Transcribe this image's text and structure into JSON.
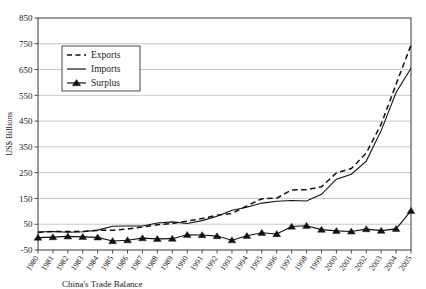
{
  "chart_data": {
    "type": "line",
    "title": "",
    "xlabel": "",
    "ylabel": "US$ Billions",
    "ylim": [
      -50,
      850
    ],
    "ytick_step": 100,
    "grid": true,
    "legend_position": "upper-left-inside",
    "yticks": [
      "-50",
      "50",
      "150",
      "250",
      "350",
      "450",
      "550",
      "650",
      "750",
      "850"
    ],
    "categories": [
      "1980",
      "1981",
      "1982",
      "1983",
      "1984",
      "1985",
      "1986",
      "1987",
      "1988",
      "1989",
      "1990",
      "1991",
      "1992",
      "1993",
      "1994",
      "1995",
      "1996",
      "1997",
      "1998",
      "1999",
      "2000",
      "2001",
      "2002",
      "2003",
      "2004",
      "2005"
    ],
    "series": [
      {
        "name": "Exports",
        "style": "dashed",
        "values": [
          18,
          22,
          22,
          22,
          26,
          27,
          31,
          39,
          48,
          53,
          62,
          72,
          85,
          92,
          121,
          149,
          151,
          183,
          184,
          195,
          249,
          266,
          326,
          438,
          593,
          745
        ]
      },
      {
        "name": "Imports",
        "style": "solid",
        "values": [
          20,
          22,
          19,
          21,
          27,
          42,
          43,
          43,
          55,
          59,
          53,
          64,
          81,
          104,
          116,
          132,
          139,
          142,
          140,
          166,
          225,
          244,
          295,
          413,
          561,
          655
        ]
      },
      {
        "name": "Surplus",
        "style": "solid-marker",
        "marker": "triangle",
        "values": [
          -2,
          0,
          3,
          1,
          -1,
          -15,
          -12,
          -4,
          -7,
          -6,
          9,
          8,
          4,
          -12,
          5,
          17,
          12,
          41,
          44,
          29,
          24,
          22,
          31,
          25,
          32,
          102
        ]
      }
    ],
    "legend": [
      {
        "label": "Exports",
        "style": "dashed"
      },
      {
        "label": "Imports",
        "style": "solid"
      },
      {
        "label": "Surplus",
        "style": "solid-marker"
      }
    ]
  },
  "caption": {
    "text": "China's Trade Balance"
  }
}
